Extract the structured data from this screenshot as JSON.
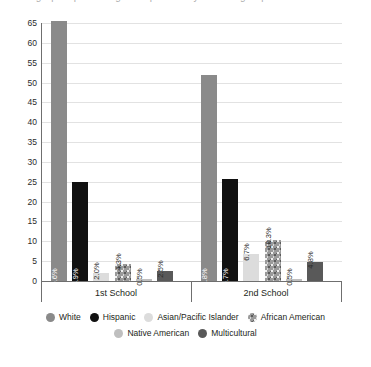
{
  "chart_data": {
    "type": "bar",
    "title": "",
    "xlabel": "",
    "ylabel": "",
    "ylim": [
      0,
      65
    ],
    "ytick_step": 5,
    "yticks": [
      65,
      60,
      55,
      50,
      45,
      40,
      35,
      30,
      25,
      20,
      15,
      10,
      5,
      0
    ],
    "grid": true,
    "legend_position": "bottom",
    "categories": [
      "1st School",
      "2nd School"
    ],
    "series": [
      {
        "name": "White",
        "color": "#8a8a8a",
        "pattern": "solid",
        "values": [
          65.6,
          51.8
        ],
        "labels": [
          "65.6%",
          "51.8%"
        ]
      },
      {
        "name": "Hispanic",
        "color": "#111111",
        "pattern": "solid",
        "values": [
          24.9,
          25.7
        ],
        "labels": [
          "24.9%",
          "25.7%"
        ]
      },
      {
        "name": "Asian/Pacific Islander",
        "color": "#dcdcdc",
        "pattern": "solid",
        "values": [
          2.0,
          6.7
        ],
        "labels": [
          "2.0%",
          "6.7%"
        ]
      },
      {
        "name": "African American",
        "color": "#9a9a9a",
        "pattern": "textured",
        "values": [
          4.3,
          10.3
        ],
        "labels": [
          "4.3%",
          "10.3%"
        ]
      },
      {
        "name": "Native American",
        "color": "#bfbfbf",
        "pattern": "solid",
        "values": [
          0.5,
          0.5
        ],
        "labels": [
          "0.5%",
          "0.5%"
        ]
      },
      {
        "name": "Multicultural",
        "color": "#595959",
        "pattern": "solid",
        "values": [
          2.5,
          4.8
        ],
        "labels": [
          "2.5%",
          "4.8%"
        ]
      }
    ]
  },
  "clipped_title": "Demographic percentage comparison by student group",
  "legend": {
    "row1": [
      "White",
      "Hispanic",
      "Asian/Pacific Islander",
      "African American"
    ],
    "row2": [
      "Native American",
      "Multicultural"
    ]
  },
  "colors": {
    "axis": "#6f6f6f",
    "grid": "#e2e2e2",
    "text": "#231f20",
    "label_inside": "#ffffff",
    "label_outside": "#2b2b2b"
  }
}
